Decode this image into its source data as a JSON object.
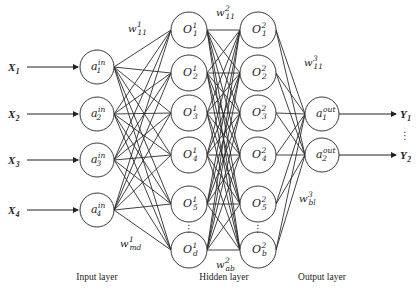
{
  "diagram": {
    "type": "neural-network",
    "inputs": [
      {
        "label": "X",
        "sub": "1",
        "y": 67
      },
      {
        "label": "X",
        "sub": "2",
        "y": 114
      },
      {
        "label": "X",
        "sub": "3",
        "y": 160
      },
      {
        "label": "X",
        "sub": "4",
        "y": 210
      }
    ],
    "input_layer": {
      "title": "Input layer",
      "x": 97,
      "nodes": [
        {
          "base": "a",
          "sub": "1",
          "sup": "in",
          "y": 67
        },
        {
          "base": "a",
          "sub": "2",
          "sup": "in",
          "y": 114
        },
        {
          "base": "a",
          "sub": "3",
          "sup": "in",
          "y": 160
        },
        {
          "base": "a",
          "sub": "4",
          "sup": "in",
          "y": 210
        }
      ]
    },
    "hidden_layer": {
      "title": "Hidden layer",
      "layers": [
        {
          "x": 189,
          "nodes": [
            {
              "base": "O",
              "sub": "1",
              "sup": "1",
              "y": 30
            },
            {
              "base": "O",
              "sub": "2",
              "sup": "1",
              "y": 73
            },
            {
              "base": "O",
              "sub": "3",
              "sup": "1",
              "y": 113
            },
            {
              "base": "O",
              "sub": "4",
              "sup": "1",
              "y": 155
            },
            {
              "base": "O",
              "sub": "5",
              "sup": "1",
              "y": 204
            },
            {
              "base": "O",
              "sub": "d",
              "sup": "1",
              "y": 250
            }
          ],
          "ellipsis_y": 228
        },
        {
          "x": 258,
          "nodes": [
            {
              "base": "O",
              "sub": "1",
              "sup": "2",
              "y": 30
            },
            {
              "base": "O",
              "sub": "2",
              "sup": "2",
              "y": 73
            },
            {
              "base": "O",
              "sub": "3",
              "sup": "2",
              "y": 113
            },
            {
              "base": "O",
              "sub": "4",
              "sup": "2",
              "y": 155
            },
            {
              "base": "O",
              "sub": "5",
              "sup": "2",
              "y": 204
            },
            {
              "base": "O",
              "sub": "b",
              "sup": "2",
              "y": 250
            }
          ],
          "ellipsis_y": 228
        }
      ]
    },
    "output_layer": {
      "title": "Output layer",
      "x": 322,
      "nodes": [
        {
          "base": "a",
          "sub": "1",
          "sup": "out",
          "y": 114
        },
        {
          "base": "a",
          "sub": "2",
          "sup": "out",
          "y": 155
        }
      ]
    },
    "outputs": [
      {
        "label": "Y",
        "sub": "1",
        "y": 114
      },
      {
        "label": "Y",
        "sub": "2",
        "y": 155
      }
    ],
    "weights": [
      {
        "base": "w",
        "sup": "1",
        "sub": "11",
        "x": 128,
        "y": 32
      },
      {
        "base": "w",
        "sup": "1",
        "sub": "md",
        "x": 120,
        "y": 247
      },
      {
        "base": "w",
        "sup": "2",
        "sub": "11",
        "x": 216,
        "y": 16
      },
      {
        "base": "w",
        "sup": "2",
        "sub": "ab",
        "x": 216,
        "y": 268
      },
      {
        "base": "w",
        "sup": "3",
        "sub": "11",
        "x": 304,
        "y": 66
      },
      {
        "base": "w",
        "sup": "3",
        "sub": "bl",
        "x": 299,
        "y": 202
      }
    ],
    "layer_label_y": 280,
    "layer_label_x": {
      "input": 97,
      "hidden": 224,
      "output": 322
    },
    "output_ellipsis": {
      "x": 405,
      "y": 135
    },
    "node_radius": 17,
    "hidden_node_radius": 18
  }
}
